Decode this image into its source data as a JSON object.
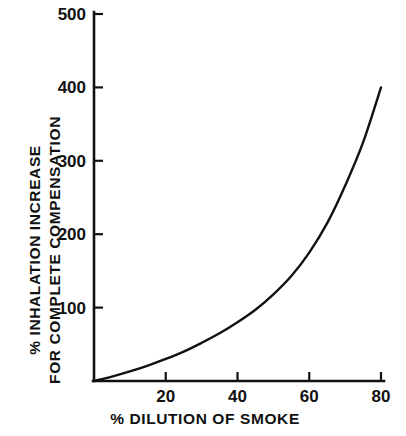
{
  "chart_data": {
    "type": "line",
    "title": "",
    "subtitle": "",
    "xlabel": "% DILUTION OF SMOKE",
    "ylabel": "% INHALATION INCREASE FOR COMPLETE COMPENSATION",
    "ylabel_line1": "% INHALATION  INCREASE",
    "ylabel_line2": "FOR COMPLETE COMPENSATION",
    "xlim": [
      0,
      82
    ],
    "ylim": [
      0,
      500
    ],
    "xticks": [
      20,
      40,
      60,
      80
    ],
    "xtick_labels": [
      "20",
      "40",
      "60",
      "80"
    ],
    "yticks": [
      100,
      200,
      300,
      400,
      500
    ],
    "ytick_labels": [
      "100",
      "200",
      "300",
      "400",
      "500"
    ],
    "grid": false,
    "legend": "none",
    "line_color": "#111111",
    "background_color": "#ffffff",
    "series": [
      {
        "name": "inhalation increase",
        "x": [
          0,
          5,
          10,
          15,
          20,
          25,
          30,
          35,
          40,
          45,
          50,
          55,
          60,
          65,
          70,
          75,
          80
        ],
        "values": [
          0,
          6,
          13,
          21,
          30,
          40,
          52,
          65,
          80,
          97,
          118,
          143,
          175,
          215,
          266,
          325,
          400
        ]
      }
    ],
    "annotations": []
  },
  "axes": {
    "x_axis_name": "x-axis",
    "y_axis_name": "y-axis"
  }
}
